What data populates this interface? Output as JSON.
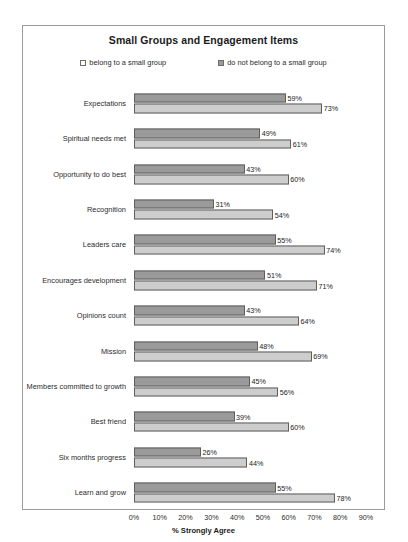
{
  "chart_data": {
    "type": "bar",
    "orientation": "horizontal",
    "title": "Small Groups and Engagement Items",
    "xlabel": "% Strongly Agree",
    "ylabel": "",
    "xlim": [
      0,
      90
    ],
    "xtick_labels": [
      "0%",
      "10%",
      "20%",
      "30%",
      "40%",
      "50%",
      "60%",
      "70%",
      "80%",
      "90%"
    ],
    "xticks": [
      0,
      10,
      20,
      30,
      40,
      50,
      60,
      70,
      80,
      90
    ],
    "grid": false,
    "legend_position": "top",
    "categories": [
      "Expectations",
      "Spiritual needs met",
      "Opportunity to do best",
      "Recognition",
      "Leaders care",
      "Encourages development",
      "Opinions count",
      "Mission",
      "Members committed to growth",
      "Best friend",
      "Six months progress",
      "Learn and grow"
    ],
    "series": [
      {
        "name": "belong to a small group",
        "color": "#9a9a9a",
        "values": [
          59,
          49,
          43,
          31,
          55,
          51,
          43,
          48,
          45,
          39,
          26,
          55
        ],
        "labels": [
          "59%",
          "49%",
          "43%",
          "31%",
          "55%",
          "51%",
          "43%",
          "48%",
          "45%",
          "39%",
          "26%",
          "55%"
        ]
      },
      {
        "name": "do not belong to a small group",
        "color": "#cdcdcd",
        "values": [
          73,
          61,
          60,
          54,
          74,
          71,
          64,
          69,
          56,
          60,
          44,
          78
        ],
        "labels": [
          "73%",
          "61%",
          "60%",
          "54%",
          "74%",
          "71%",
          "64%",
          "69%",
          "56%",
          "60%",
          "44%",
          "78%"
        ]
      }
    ]
  },
  "legend": {
    "items": [
      {
        "label": "belong to a small group"
      },
      {
        "label": "do not belong to a small group"
      }
    ]
  }
}
